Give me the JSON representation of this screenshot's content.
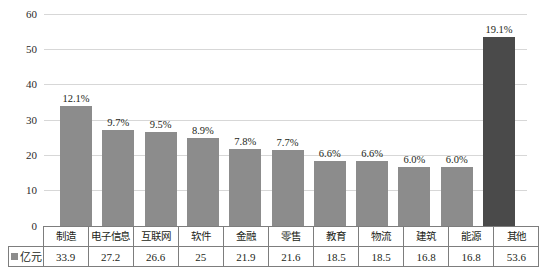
{
  "chart_data": {
    "type": "bar",
    "title": "",
    "xlabel": "",
    "ylabel": "",
    "ylim": [
      0,
      60
    ],
    "yticks": [
      0,
      10,
      20,
      30,
      40,
      50,
      60
    ],
    "grid": true,
    "legend_position": "bottom-left",
    "categories": [
      "制造",
      "电子信息",
      "互联网",
      "软件",
      "金融",
      "零售",
      "教育",
      "物流",
      "建筑",
      "能源",
      "其他"
    ],
    "series": [
      {
        "name": "亿元",
        "values": [
          33.9,
          27.2,
          26.6,
          25,
          21.9,
          21.6,
          18.5,
          18.5,
          16.8,
          16.8,
          53.6
        ],
        "value_texts": [
          "33.9",
          "27.2",
          "26.6",
          "25",
          "21.9",
          "21.6",
          "18.5",
          "18.5",
          "16.8",
          "16.8",
          "53.6"
        ]
      }
    ],
    "data_labels": [
      "12.1%",
      "9.7%",
      "9.5%",
      "8.9%",
      "7.8%",
      "7.7%",
      "6.6%",
      "6.6%",
      "6.0%",
      "6.0%",
      "19.1%"
    ],
    "bar_colors": [
      "#8c8c8c",
      "#8c8c8c",
      "#8c8c8c",
      "#8c8c8c",
      "#8c8c8c",
      "#8c8c8c",
      "#8c8c8c",
      "#8c8c8c",
      "#8c8c8c",
      "#8c8c8c",
      "#4a4a4a"
    ],
    "highlight_index": 10,
    "colors": {
      "bar": "#8c8c8c",
      "bar_highlight": "#4a4a4a",
      "gridline": "#d7d7d7",
      "baseline": "#b9b9b9",
      "table_border": "#7d7d7d",
      "text": "#231f20"
    }
  },
  "table": {
    "legend_label": "亿元",
    "row_names": [
      "制造",
      "电子信息",
      "互联网",
      "软件",
      "金融",
      "零售",
      "教育",
      "物流",
      "建筑",
      "能源",
      "其他"
    ],
    "row_values": [
      "33.9",
      "27.2",
      "26.6",
      "25",
      "21.9",
      "21.6",
      "18.5",
      "18.5",
      "16.8",
      "16.8",
      "53.6"
    ]
  },
  "yaxis": {
    "ticks": [
      "60",
      "50",
      "40",
      "30",
      "20",
      "10",
      "0"
    ]
  }
}
